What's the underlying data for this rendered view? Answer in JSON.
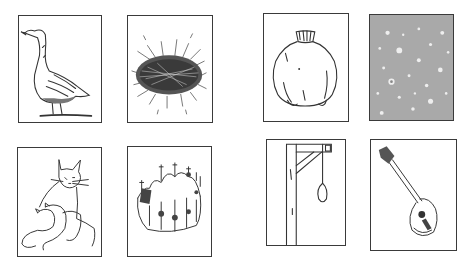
{
  "layout": {
    "groups": 2,
    "cards_per_group": 4,
    "grid": "2x2 per group"
  },
  "cards": [
    {
      "id": "goose",
      "label": "goose",
      "group": 1,
      "row": 1,
      "col": 1
    },
    {
      "id": "nest",
      "label": "nest",
      "group": 1,
      "row": 1,
      "col": 2
    },
    {
      "id": "cats",
      "label": "cat with kittens",
      "group": 1,
      "row": 2,
      "col": 1
    },
    {
      "id": "crown",
      "label": "crown",
      "group": 1,
      "row": 2,
      "col": 2
    },
    {
      "id": "pomegranate",
      "label": "pomegranate",
      "group": 2,
      "row": 1,
      "col": 1
    },
    {
      "id": "rain",
      "label": "rain",
      "group": 2,
      "row": 1,
      "col": 2
    },
    {
      "id": "gallows",
      "label": "gallows",
      "group": 2,
      "row": 2,
      "col": 1
    },
    {
      "id": "mandolin",
      "label": "mandolin",
      "group": 2,
      "row": 2,
      "col": 2
    }
  ],
  "colors": {
    "stroke": "#3a3a3a",
    "rain_bg": "#a9a9a9",
    "background": "#ffffff"
  }
}
